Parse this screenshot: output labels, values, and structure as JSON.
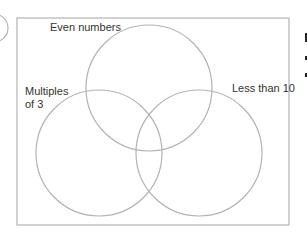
{
  "diagram": {
    "type": "venn",
    "sets": [
      {
        "label": "Even numbers"
      },
      {
        "label_line1": "Multiples",
        "label_line2": "of 3"
      },
      {
        "label": "Less than 10"
      }
    ],
    "colors": {
      "stroke": "#b3b3b3",
      "text": "#333333",
      "background": "#ffffff"
    }
  }
}
